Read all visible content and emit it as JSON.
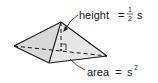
{
  "figure": {
    "labels": {
      "height": {
        "name": "height",
        "equals": "=",
        "frac_num": "1",
        "frac_den": "2",
        "variable": "s"
      },
      "area": {
        "name": "area",
        "equals": "=",
        "variable": "s",
        "exponent": "2"
      }
    },
    "colors": {
      "face_left": "#d6d6d6",
      "face_front": "#e9e9e9",
      "face_right": "#c4c4c4",
      "edge": "#1a1a1a",
      "text": "#1a1a1a"
    }
  }
}
